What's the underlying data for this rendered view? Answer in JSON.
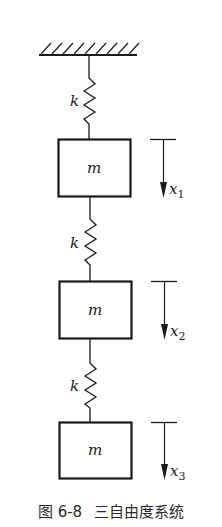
{
  "diagram": {
    "type": "three-degree-of-freedom mass-spring system",
    "support": {
      "label": "fixed-ground"
    },
    "springs": [
      {
        "label": "k"
      },
      {
        "label": "k"
      },
      {
        "label": "k"
      }
    ],
    "masses": [
      {
        "label": "m",
        "displacement": "x",
        "subscript": "1"
      },
      {
        "label": "m",
        "displacement": "x",
        "subscript": "2"
      },
      {
        "label": "m",
        "displacement": "x",
        "subscript": "3"
      }
    ],
    "caption": {
      "figure_number": "图 6-8",
      "title": "三自由度系统"
    },
    "colors": {
      "stroke": "#1a1a1a",
      "background": "#ffffff"
    }
  }
}
